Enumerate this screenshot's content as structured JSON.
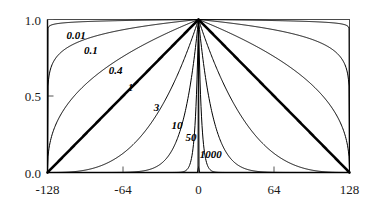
{
  "chart_data": {
    "type": "line",
    "title": "",
    "xlabel": "",
    "ylabel": "",
    "xlim": [
      -128,
      128
    ],
    "ylim": [
      0.0,
      1.0
    ],
    "grid": false,
    "legend": "inline-curve-labels",
    "x_ticks": [
      -128,
      -64,
      0,
      64,
      128
    ],
    "x_tick_labels": [
      "-128",
      "-64",
      "0",
      "64",
      "128"
    ],
    "y_ticks": [
      0.0,
      0.5,
      1.0
    ],
    "y_tick_labels": [
      "0.0",
      "0.5",
      "1.0"
    ],
    "note": "Family of symmetric curves y = (1 - |x|/128)^p, all peaking at (0, 1.0) and reaching 0.0 at x = +/-128. Each curve is annotated with its parameter value.",
    "series": [
      {
        "name": "0.01",
        "exponent": 0.01,
        "emphasis": false,
        "label_x": -112,
        "label_y": 0.875
      },
      {
        "name": "0.1",
        "exponent": 0.1,
        "emphasis": false,
        "label_x": -97,
        "label_y": 0.775
      },
      {
        "name": "0.4",
        "exponent": 0.4,
        "emphasis": false,
        "label_x": -76,
        "label_y": 0.645
      },
      {
        "name": "1",
        "exponent": 1.0,
        "emphasis": true,
        "label_x": -60,
        "label_y": 0.535
      },
      {
        "name": "3",
        "exponent": 3.0,
        "emphasis": false,
        "label_x": -38,
        "label_y": 0.405
      },
      {
        "name": "10",
        "exponent": 10.0,
        "emphasis": false,
        "label_x": -23,
        "label_y": 0.285
      },
      {
        "name": "50",
        "exponent": 50.0,
        "emphasis": false,
        "label_x": -11,
        "label_y": 0.205
      },
      {
        "name": "1000",
        "exponent": 1000.0,
        "emphasis": false,
        "label_x": 1,
        "label_y": 0.095
      }
    ],
    "mirrored": true
  },
  "axes": {
    "x_tick_labels": [
      "-128",
      "-64",
      "0",
      "64",
      "128"
    ],
    "y_tick_labels": [
      "1.0",
      "0.5",
      "0.0"
    ]
  },
  "curve_labels": [
    "0.01",
    "0.1",
    "0.4",
    "1",
    "3",
    "10",
    "50",
    "1000"
  ]
}
